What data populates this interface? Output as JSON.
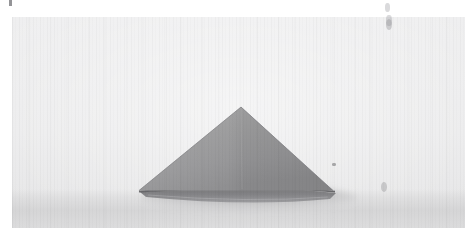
{
  "page": {
    "background_color": "#ffffff",
    "width": 475,
    "height": 243,
    "caption": ""
  },
  "photograph": {
    "name": "folded-paper-triangle-photo",
    "kind": "grayscale-scanned-photograph",
    "description": "Folded paper triangle resting on a flat light surface",
    "frame": {
      "left": 12,
      "top": 17,
      "width": 453,
      "height": 211
    },
    "background_color": "#eaeaeb",
    "surface_color": "#d6d6d7",
    "alt_text": "A sheet of paper folded into a low triangular form, photographed against a plain pale background"
  },
  "object": {
    "name": "paper-triangle",
    "apex": {
      "x": 241,
      "y": 107
    },
    "base_left": {
      "x": 139,
      "y": 190
    },
    "base_right": {
      "x": 333,
      "y": 190
    },
    "face_color_light": "#9d9d9e",
    "face_color_dark": "#8d8d8f",
    "edge_color": "#6f6f72",
    "lower_flap_color": "#7c7c7f",
    "shadow_color": "#b9b9bb"
  },
  "blemishes": [
    {
      "name": "speck-top-left",
      "x": 9,
      "y": 1,
      "w": 3,
      "h": 5
    },
    {
      "name": "speck-right-of-triangle",
      "x": 332,
      "y": 163,
      "w": 4,
      "h": 3
    },
    {
      "name": "smudge-top-right",
      "x": 385,
      "y": 4,
      "w": 5,
      "h": 9
    },
    {
      "name": "smudge-top-right-2",
      "x": 386,
      "y": 17,
      "w": 6,
      "h": 10
    },
    {
      "name": "smudge-bottom-right",
      "x": 381,
      "y": 182,
      "w": 6,
      "h": 9
    }
  ]
}
